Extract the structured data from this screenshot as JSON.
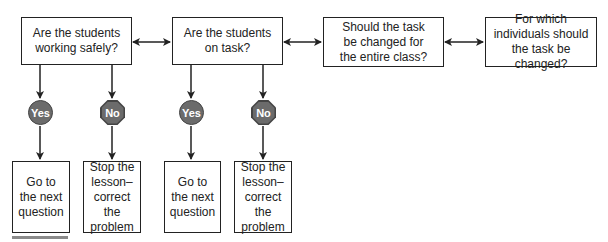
{
  "diagram": {
    "questions": [
      {
        "id": "q1",
        "label": "Are the students\nworking safely?"
      },
      {
        "id": "q2",
        "label": "Are the students\non task?"
      },
      {
        "id": "q3",
        "label": "Should the task\nbe changed for\nthe entire class?"
      },
      {
        "id": "q4",
        "label": "For which\nindividuals should\nthe task be changed?"
      }
    ],
    "badges": {
      "yes": "Yes",
      "no": "No"
    },
    "outcomes": {
      "q1_yes": "Go to\nthe next\nquestion",
      "q1_no": "Stop the\nlesson–\ncorrect the\nproblem",
      "q2_yes": "Go to\nthe next\nquestion",
      "q2_no": "Stop the\nlesson–\ncorrect the\nproblem"
    },
    "connectors": {
      "q1_q2": "bidirectional",
      "q2_q3": "bidirectional",
      "q3_q4": "bidirectional"
    },
    "colors": {
      "line": "#222222",
      "badge_fill": "#6b6b6b",
      "badge_border": "#444444",
      "badge_text": "#ffffff",
      "rule": "#8a8a8a"
    }
  }
}
